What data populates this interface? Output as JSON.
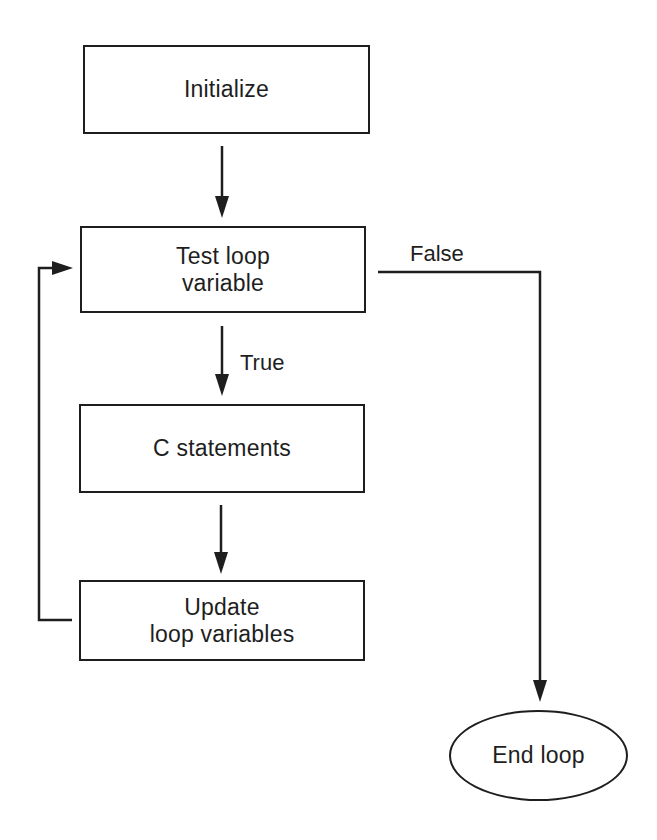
{
  "diagram": {
    "type": "flowchart",
    "nodes": [
      {
        "id": "initialize",
        "shape": "rectangle",
        "lines": [
          "Initialize"
        ]
      },
      {
        "id": "test",
        "shape": "rectangle",
        "lines": [
          "Test loop",
          "variable"
        ]
      },
      {
        "id": "statements",
        "shape": "rectangle",
        "lines": [
          "C statements"
        ]
      },
      {
        "id": "update",
        "shape": "rectangle",
        "lines": [
          "Update",
          "loop variables"
        ]
      },
      {
        "id": "end",
        "shape": "oval",
        "lines": [
          "End loop"
        ]
      }
    ],
    "edges": [
      {
        "from": "initialize",
        "to": "test",
        "label": ""
      },
      {
        "from": "test",
        "to": "statements",
        "label": "True"
      },
      {
        "from": "statements",
        "to": "update",
        "label": ""
      },
      {
        "from": "update",
        "to": "test",
        "label": ""
      },
      {
        "from": "test",
        "to": "end",
        "label": "False"
      }
    ],
    "colors": {
      "stroke": "#1e1e1e",
      "background": "#ffffff",
      "text": "#1e1e1e"
    }
  }
}
